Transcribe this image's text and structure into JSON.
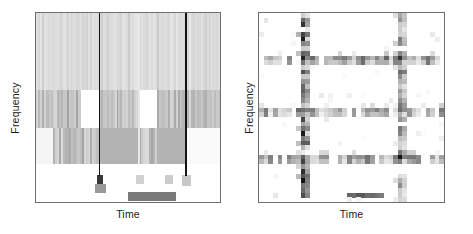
{
  "figure": {
    "title": "",
    "background": "#ffffff",
    "panel_count": 2
  },
  "panels": [
    {
      "id": "left",
      "name": "dense-spectrogram",
      "xlabel": "Time",
      "ylabel": "Frequency",
      "border_color": "#6e6e6e"
    },
    {
      "id": "right",
      "name": "sparse-spectrogram",
      "xlabel": "Time",
      "ylabel": "Frequency",
      "border_color": "#6e6e6e"
    }
  ],
  "chart_data": [
    {
      "type": "heatmap",
      "name": "left-panel-dense-spectrogram",
      "title": "",
      "xlabel": "Time",
      "ylabel": "Frequency",
      "colormap": "grayscale_inverted",
      "colormap_range": [
        "#ffffff",
        "#000000"
      ],
      "grid": false,
      "legend": "none",
      "xlim": [
        0,
        1
      ],
      "ylim": [
        0,
        1
      ],
      "description": "Dense time-frequency spectrogram with fine vertical striations, three horizontal intensity bands, three strong vertical transient lines and dark low-frequency blocks along the bottom.",
      "n_time_bins": 96,
      "n_freq_bins": 24,
      "horizontal_bands": [
        {
          "name": "upper-band",
          "y_from": 0.0,
          "y_to": 0.41,
          "base_value": 0.13
        },
        {
          "name": "mid-band",
          "y_from": 0.41,
          "y_to": 0.61,
          "base_value": 0.22
        },
        {
          "name": "lower-band",
          "y_from": 0.61,
          "y_to": 0.8,
          "base_value": 0.31
        },
        {
          "name": "floor-band",
          "y_from": 0.8,
          "y_to": 1.0,
          "base_value": 0.02
        }
      ],
      "vertical_transients": [
        {
          "name": "transient-1",
          "x": 0.345,
          "value": 0.92,
          "y_from": 0.0,
          "y_to": 0.86
        },
        {
          "name": "transient-2",
          "x": 0.56,
          "value": 0.1,
          "y_from": 0.0,
          "y_to": 0.8
        },
        {
          "name": "transient-3",
          "x": 0.815,
          "value": 0.92,
          "y_from": 0.0,
          "y_to": 0.86
        }
      ],
      "white_gaps": [
        {
          "x_from": 0.245,
          "x_to": 0.34,
          "y_from": 0.41,
          "y_to": 0.61
        },
        {
          "x_from": 0.56,
          "x_to": 0.655,
          "y_from": 0.41,
          "y_to": 0.61
        },
        {
          "x_from": 0.345,
          "x_to": 0.56,
          "y_from": 0.61,
          "y_to": 0.8,
          "value": 0.3
        },
        {
          "x_from": 0.0,
          "x_to": 0.1,
          "y_from": 0.61,
          "y_to": 0.8
        }
      ],
      "bottom_blocks": [
        {
          "x_from": 0.33,
          "x_to": 0.365,
          "y_from": 0.855,
          "y_to": 0.905,
          "value": 0.78
        },
        {
          "x_from": 0.32,
          "x_to": 0.38,
          "y_from": 0.905,
          "y_to": 0.95,
          "value": 0.4
        },
        {
          "x_from": 0.545,
          "x_to": 0.585,
          "y_from": 0.855,
          "y_to": 0.905,
          "value": 0.18
        },
        {
          "x_from": 0.7,
          "x_to": 0.745,
          "y_from": 0.855,
          "y_to": 0.905,
          "value": 0.2
        },
        {
          "x_from": 0.5,
          "x_to": 0.76,
          "y_from": 0.945,
          "y_to": 0.995,
          "value": 0.52
        },
        {
          "x_from": 0.795,
          "x_to": 0.84,
          "y_from": 0.855,
          "y_to": 0.915,
          "value": 0.22
        }
      ],
      "stripe_values": [
        0.1,
        0.18,
        0.12,
        0.22,
        0.09,
        0.16,
        0.25,
        0.11,
        0.19,
        0.14,
        0.08,
        0.21,
        0.15,
        0.23,
        0.1,
        0.17,
        0.26,
        0.12,
        0.2,
        0.13,
        0.09,
        0.24,
        0.16,
        0.11,
        0.22,
        0.14,
        0.18,
        0.1,
        0.25,
        0.13,
        0.19,
        0.08,
        0.21,
        0.15,
        0.23,
        0.12,
        0.17,
        0.26,
        0.11,
        0.2,
        0.14,
        0.09,
        0.24,
        0.16,
        0.22,
        0.1,
        0.18,
        0.13,
        0.25,
        0.12,
        0.19,
        0.15,
        0.08,
        0.23,
        0.17,
        0.11,
        0.21,
        0.14,
        0.26,
        0.1,
        0.2,
        0.13,
        0.18,
        0.24,
        0.09,
        0.22,
        0.16,
        0.12,
        0.19,
        0.25,
        0.11,
        0.15,
        0.23,
        0.1,
        0.21,
        0.14,
        0.17,
        0.26,
        0.13,
        0.2,
        0.09,
        0.22,
        0.18,
        0.12,
        0.24,
        0.15,
        0.11,
        0.19,
        0.25,
        0.1,
        0.23,
        0.16,
        0.13,
        0.21,
        0.14,
        0.17
      ]
    },
    {
      "type": "heatmap",
      "name": "right-panel-sparse-spectrogram",
      "title": "",
      "xlabel": "Time",
      "ylabel": "Frequency",
      "colormap": "grayscale_inverted",
      "colormap_range": [
        "#ffffff",
        "#000000"
      ],
      "grid": false,
      "legend": "none",
      "xlim": [
        0,
        1
      ],
      "ylim": [
        0,
        1
      ],
      "description": "Sparse blocky time-frequency representation: three horizontal ridges and two vertical ridges of discrete cells on a mostly white field, with the darkest cells at ridge intersections.",
      "n_time_bins": 40,
      "n_freq_bins": 40,
      "horizontal_ridges": [
        {
          "name": "ridge-high",
          "row": 9,
          "mean_value": 0.34
        },
        {
          "name": "ridge-mid",
          "row": 20,
          "mean_value": 0.32
        },
        {
          "name": "ridge-low",
          "row": 30,
          "mean_value": 0.3
        }
      ],
      "vertical_ridges": [
        {
          "name": "vridge-left",
          "col": 9,
          "mean_value": 0.38
        },
        {
          "name": "vridge-right",
          "col": 30,
          "mean_value": 0.3
        }
      ],
      "intersections": [
        {
          "row": 9,
          "col": 9,
          "value": 0.85
        },
        {
          "row": 9,
          "col": 30,
          "value": 0.8
        },
        {
          "row": 20,
          "col": 9,
          "value": 0.55
        },
        {
          "row": 20,
          "col": 30,
          "value": 0.58
        },
        {
          "row": 30,
          "col": 9,
          "value": 0.62
        },
        {
          "row": 30,
          "col": 30,
          "value": 0.92
        }
      ],
      "bottom_segment": {
        "row": 38,
        "col_from": 19,
        "col_to": 26,
        "value": 0.6
      },
      "isolated_peaks": [
        {
          "row": 2,
          "col": 9,
          "value": 0.8
        },
        {
          "row": 5,
          "col": 9,
          "value": 0.88
        },
        {
          "row": 22,
          "col": 9,
          "value": 0.72
        },
        {
          "row": 25,
          "col": 9,
          "value": 0.9
        },
        {
          "row": 33,
          "col": 9,
          "value": 0.82
        },
        {
          "row": 35,
          "col": 9,
          "value": 0.92
        },
        {
          "row": 38,
          "col": 9,
          "value": 0.7
        },
        {
          "row": 1,
          "col": 30,
          "value": 0.42
        },
        {
          "row": 36,
          "col": 30,
          "value": 0.45
        }
      ]
    }
  ]
}
